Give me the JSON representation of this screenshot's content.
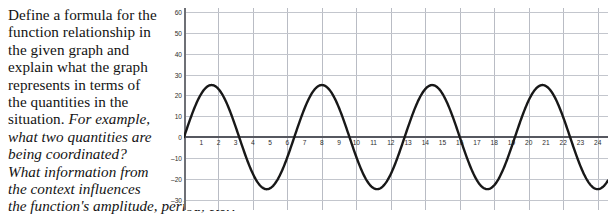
{
  "prompt": {
    "lines": [
      {
        "text": "Define a formula for the",
        "italic": false
      },
      {
        "text": "function relationship in",
        "italic": false
      },
      {
        "text": "the given graph and",
        "italic": false
      },
      {
        "text": "explain what the graph",
        "italic": false
      },
      {
        "text": "represents in terms of",
        "italic": false
      },
      {
        "text": "the quantities in the",
        "italic": false
      },
      {
        "text": "situation. For example,",
        "italic": "partial"
      },
      {
        "text": "what two quantities are",
        "italic": true
      },
      {
        "text": "being coordinated?",
        "italic": true
      },
      {
        "text": "What information from",
        "italic": true
      },
      {
        "text": "the context influences",
        "italic": true
      }
    ],
    "line7_plain": "situation. ",
    "line7_italic": "For example,",
    "last_line": "the function's amplitude, period, etc.?"
  },
  "chart_data": {
    "type": "line",
    "title": "",
    "xlabel": "",
    "ylabel": "",
    "xlim": [
      0,
      24.6
    ],
    "ylim": [
      -35,
      62
    ],
    "xticks": [
      1,
      2,
      3,
      4,
      5,
      6,
      7,
      8,
      9,
      10,
      11,
      12,
      13,
      14,
      15,
      16,
      17,
      18,
      19,
      20,
      21,
      22,
      23,
      24
    ],
    "yticks": [
      60,
      50,
      40,
      30,
      20,
      10,
      0,
      -10,
      -20,
      -30
    ],
    "grid": true,
    "grid_x_step": 2,
    "grid_y_step": 10,
    "legend": "none",
    "series": [
      {
        "name": "sinusoid",
        "function": "y = 25 * sin(2*pi*x/6.4)",
        "amplitude": 25,
        "period": 6.4,
        "midline": 0,
        "phase_shift": 0,
        "x": [
          0,
          0.4,
          0.8,
          1.2,
          1.6,
          2.0,
          2.4,
          2.8,
          3.2,
          3.6,
          4.0,
          4.4,
          4.8,
          5.2,
          5.6,
          6.0,
          6.4,
          6.8,
          7.2,
          7.6,
          8.0,
          8.4,
          8.8,
          9.2,
          9.6,
          10.0,
          10.4,
          10.8,
          11.2,
          11.6,
          12.0,
          12.4,
          12.8,
          13.2,
          13.6,
          14.0,
          14.4,
          14.8,
          15.2,
          15.6,
          16.0,
          16.4,
          16.8,
          17.2,
          17.6,
          18.0,
          18.4,
          18.8,
          19.2,
          19.6,
          20.0,
          20.4,
          20.8,
          21.2,
          21.6,
          22.0,
          22.4,
          22.8,
          23.2,
          23.6,
          24.0,
          24.4
        ],
        "y": [
          0,
          9.6,
          17.7,
          23.1,
          25.0,
          23.1,
          17.7,
          9.6,
          0,
          -9.6,
          -17.7,
          -23.1,
          -25.0,
          -23.1,
          -17.7,
          -9.6,
          0,
          9.6,
          17.7,
          23.1,
          25.0,
          23.1,
          17.7,
          9.6,
          0,
          -9.6,
          -17.7,
          -23.1,
          -25.0,
          -23.1,
          -17.7,
          -9.6,
          0,
          9.6,
          17.7,
          23.1,
          25.0,
          23.1,
          17.7,
          9.6,
          0,
          -9.6,
          -17.7,
          -23.1,
          -25.0,
          -23.1,
          -17.7,
          -9.6,
          0,
          9.6,
          17.7,
          23.1,
          25.0,
          23.1,
          17.7,
          9.6,
          0,
          -9.6,
          -17.7,
          -23.1,
          -25.0,
          -23.1
        ],
        "color": "#181818"
      }
    ]
  },
  "style": {
    "grid_color": "#b9bcc4",
    "axis_color": "#565860",
    "curve_color": "#181818",
    "background": "#ffffff"
  }
}
